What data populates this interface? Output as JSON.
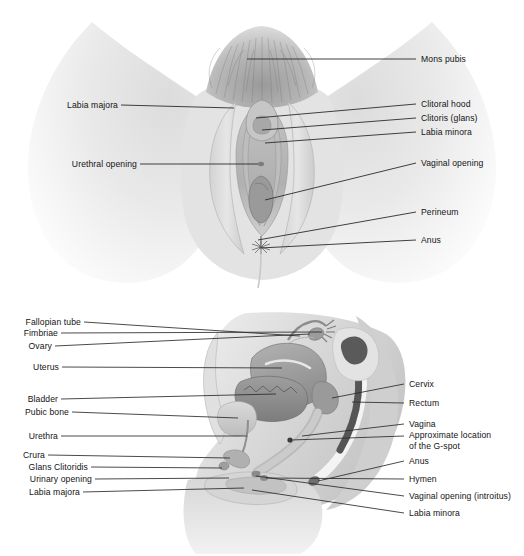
{
  "figure": {
    "type": "anatomical-illustration",
    "panels": [
      {
        "id": "panel-top",
        "view": "anterior-external-vulva",
        "labels_right": [
          {
            "key": "mons-pubis",
            "text": "Mons pubis"
          },
          {
            "key": "clitoral-hood",
            "text": "Clitoral hood"
          },
          {
            "key": "clitoris-glans",
            "text": "Clitoris (glans)"
          },
          {
            "key": "labia-minora",
            "text": "Labia minora"
          },
          {
            "key": "vaginal-opening",
            "text": "Vaginal opening"
          },
          {
            "key": "perineum",
            "text": "Perineum"
          },
          {
            "key": "anus",
            "text": "Anus"
          }
        ],
        "labels_left": [
          {
            "key": "labia-majora",
            "text": "Labia majora"
          },
          {
            "key": "urethral-opening",
            "text": "Urethral opening"
          }
        ]
      },
      {
        "id": "panel-bottom",
        "view": "mid-sagittal-section",
        "labels_left": [
          {
            "key": "fallopian-tube",
            "text": "Fallopian tube"
          },
          {
            "key": "fimbriae",
            "text": "Fimbriae"
          },
          {
            "key": "ovary",
            "text": "Ovary"
          },
          {
            "key": "uterus",
            "text": "Uterus"
          },
          {
            "key": "bladder",
            "text": "Bladder"
          },
          {
            "key": "pubic-bone",
            "text": "Pubic bone"
          },
          {
            "key": "urethra",
            "text": "Urethra"
          },
          {
            "key": "crura",
            "text": "Crura"
          },
          {
            "key": "glans-clitoridis",
            "text": "Glans Clitoridis"
          },
          {
            "key": "urinary-opening",
            "text": "Urinary opening"
          },
          {
            "key": "labia-majora",
            "text": "Labia majora"
          }
        ],
        "labels_right": [
          {
            "key": "cervix",
            "text": "Cervix"
          },
          {
            "key": "rectum",
            "text": "Rectum"
          },
          {
            "key": "vagina",
            "text": "Vagina"
          },
          {
            "key": "g-spot-line1",
            "text": "Approximate location"
          },
          {
            "key": "g-spot-line2",
            "text": "of the G-spot"
          },
          {
            "key": "anus",
            "text": "Anus"
          },
          {
            "key": "hymen",
            "text": "Hymen"
          },
          {
            "key": "vaginal-opening-introitus",
            "text": "Vaginal opening (introitus)"
          },
          {
            "key": "labia-minora",
            "text": "Labia minora"
          }
        ]
      }
    ],
    "colors": {
      "leader_line": "#2b2b2b",
      "label_text": "#141414",
      "background": "#ffffff",
      "skin_light": "#e9e9e9",
      "skin_mid": "#d2d2d2",
      "skin_shadow": "#b4b4b4",
      "organ_mid": "#a9a9a9",
      "organ_dark": "#8a8a8a",
      "cavity_dark": "#4a4a4a",
      "highlight": "#f6f6f6"
    }
  }
}
